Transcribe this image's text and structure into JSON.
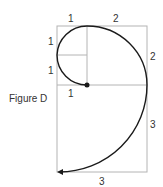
{
  "figure": {
    "title": "Figure D",
    "colors": {
      "grid": "#b4b4b4",
      "curve": "#1a1a1a",
      "text": "#333333"
    },
    "labels": {
      "top_left": "1",
      "top_right": "2",
      "left_upper": "1",
      "left_lower": "1",
      "center_bottom": "1",
      "right_upper": "2",
      "right_lower": "3",
      "bottom": "3"
    }
  }
}
